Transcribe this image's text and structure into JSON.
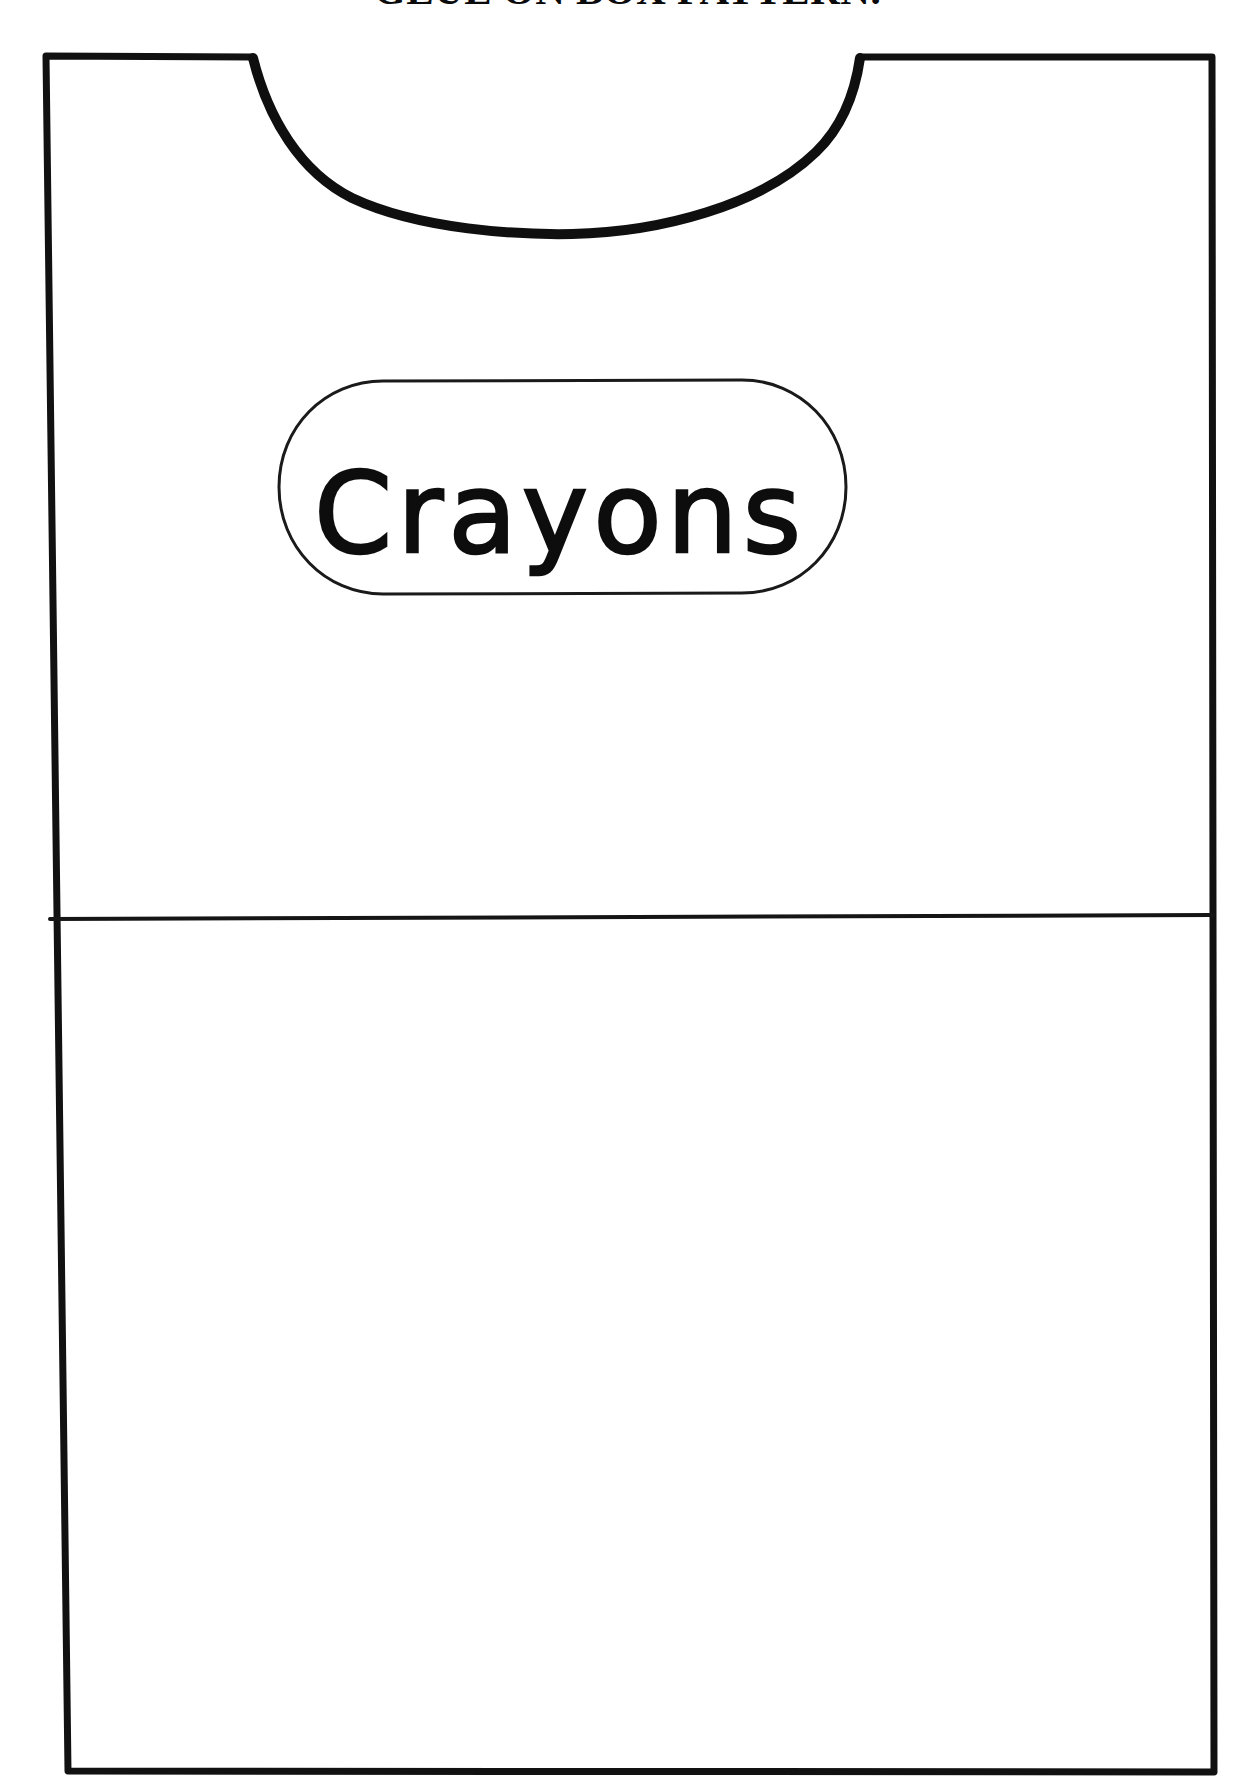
{
  "page": {
    "title": "GLUE ON BOX PATTERN.",
    "background_color": "#ffffff",
    "ink_color": "#0d0d0d",
    "width": 1255,
    "height": 1792
  },
  "artwork": {
    "name": "crayon-box-shirt-pattern",
    "description": "Line-art craft cut-out pattern shaped like a shirt / box wrap with a scooped neckline, a horizontal fold line and a rounded label.",
    "outline": {
      "name": "pattern-outline",
      "stroke_color": "#111111",
      "stroke_width": 7
    },
    "neckline": {
      "name": "neckline-curve",
      "stroke_color": "#111111",
      "stroke_width": 9,
      "left_shoulder_x": 252,
      "right_shoulder_x": 860,
      "depth_y": 212
    },
    "fold_line": {
      "name": "fold-line",
      "stroke_color": "#111111",
      "stroke_width": 4,
      "y": 920
    },
    "label": {
      "name": "crayons-label",
      "text": "Crayons",
      "shape": "stadium",
      "stroke_color": "#1a1a1a",
      "stroke_width": 3,
      "x": 275,
      "y": 380,
      "width": 570,
      "height": 215
    }
  }
}
